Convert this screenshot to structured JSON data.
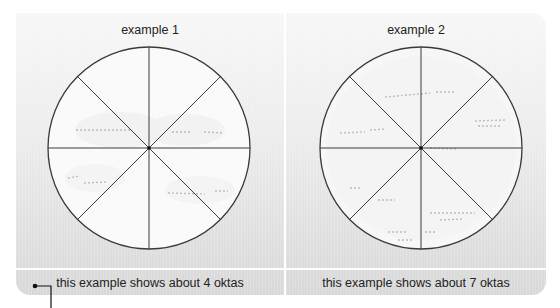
{
  "examples": [
    {
      "title": "example 1",
      "caption": "this example shows about 4 oktas",
      "oktas": 4,
      "cloudy_sectors": [
        0,
        1,
        5,
        6
      ]
    },
    {
      "title": "example 2",
      "caption": "this example shows about 7 oktas",
      "oktas": 7,
      "cloudy_sectors": [
        0,
        1,
        2,
        3,
        4,
        5,
        6
      ]
    }
  ],
  "colors": {
    "circle_stroke": "#3a3a3a",
    "circle_fill": "#ffffff",
    "background_top": "#f7f7f7",
    "background_bottom": "#d8d8d8",
    "divider": "#ffffff",
    "text": "#222222"
  },
  "icons": {
    "connector": "connector-line-icon",
    "sky_dome": "okta-circle-icon"
  }
}
